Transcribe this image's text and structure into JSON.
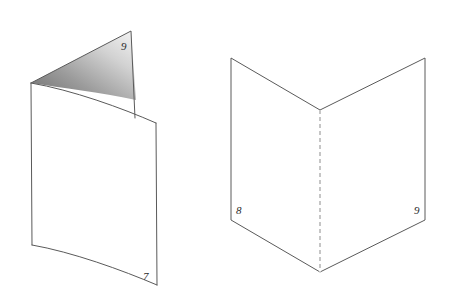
{
  "canvas": {
    "width": 453,
    "height": 308,
    "background_color": "#ffffff"
  },
  "style": {
    "stroke_color": "#5a5a5a",
    "stroke_width": 1,
    "dashed_stroke_color": "#8d8d8d",
    "dash_pattern": "4 3",
    "label_color": "#2b2b2b",
    "shade_dark": "#6e6e6e",
    "shade_mid": "#a8a8a8",
    "shade_light": "#f2f2f2"
  },
  "figures": [
    {
      "id": "left-figure",
      "name": "folded-sheet-partially-closed",
      "description": "Folded sheet of paper seen nearly edge-on with a shaded inner triangular face",
      "faces": [
        {
          "name": "front-panel",
          "filled": false,
          "vertices": [
            [
              31,
              83
            ],
            [
              156,
              123
            ],
            [
              157,
              285
            ],
            [
              32,
              245
            ]
          ]
        },
        {
          "name": "back-panel",
          "filled": false,
          "vertices": [
            [
              31,
              83
            ],
            [
              131,
              31
            ],
            [
              135,
              118
            ]
          ]
        },
        {
          "name": "inner-shaded-triangle",
          "filled": true,
          "gradient": "dark-lower-left-to-light-upper-right",
          "vertices": [
            [
              31,
              83
            ],
            [
              131,
              31
            ],
            [
              136,
              100
            ]
          ]
        }
      ],
      "labels": [
        {
          "text": "9",
          "x": 121,
          "y": 50,
          "name": "vertex-label-9"
        },
        {
          "text": "7",
          "x": 143,
          "y": 280,
          "name": "vertex-label-7"
        }
      ]
    },
    {
      "id": "right-figure",
      "name": "folded-sheet-open-v-shape",
      "description": "Open folded sheet forming a V, with dashed fold crease down the middle",
      "faces": [
        {
          "name": "left-panel",
          "filled": false,
          "vertices": [
            [
              231,
              58
            ],
            [
              320,
              110
            ],
            [
              320,
              272
            ],
            [
              231,
              220
            ]
          ]
        },
        {
          "name": "right-panel",
          "filled": false,
          "vertices": [
            [
              425,
              58
            ],
            [
              320,
              110
            ],
            [
              320,
              272
            ],
            [
              425,
              220
            ]
          ]
        }
      ],
      "fold_line": {
        "name": "center-fold-crease",
        "dashed": true,
        "from": [
          320,
          110
        ],
        "to": [
          320,
          272
        ]
      },
      "labels": [
        {
          "text": "8",
          "x": 236,
          "y": 214,
          "name": "vertex-label-8"
        },
        {
          "text": "9",
          "x": 414,
          "y": 214,
          "name": "vertex-label-9"
        }
      ]
    }
  ]
}
